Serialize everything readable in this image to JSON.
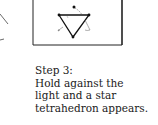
{
  "figure": {
    "icons": {
      "frame": "drawing-frame",
      "triangle": "inverted-triangle",
      "apex_dot": "vertex-dot",
      "arrows": "fold-arrow"
    }
  },
  "caption": {
    "step": "Step 3:",
    "lines": [
      "Hold against the",
      "light and a star",
      "tetrahedron appears."
    ]
  }
}
